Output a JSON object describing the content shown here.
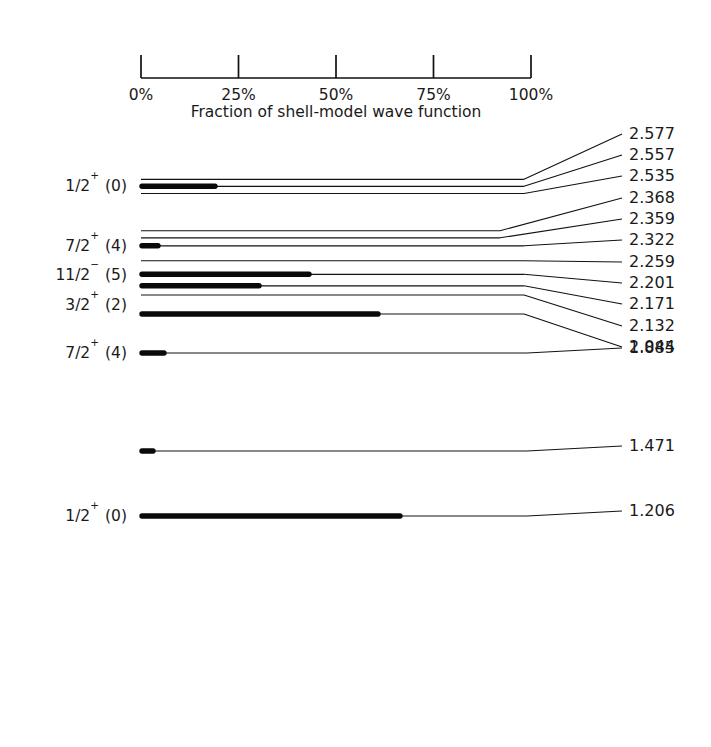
{
  "figure": {
    "kind": "nuclear-energy-level-diagram",
    "background_color": "#ffffff",
    "line_color": "#121212"
  },
  "scale_axis": {
    "caption": "Fraction of shell-model wave function",
    "tick_labels": [
      "0%",
      "25%",
      "50%",
      "75%",
      "100%"
    ],
    "tick_values": [
      0,
      25,
      50,
      75,
      100
    ],
    "x_start_px": 141,
    "x_end_px": 531,
    "baseline_y_px": 78,
    "tick_top_y_px": 55
  },
  "chart_data": {
    "type": "bar",
    "title": "",
    "subtitle": "",
    "xlabel": "Fraction of shell-model wave function",
    "ylabel": "Excitation energy (MeV)",
    "xlim": [
      0,
      100
    ],
    "xticks": [
      0,
      25,
      50,
      75,
      100
    ],
    "xticklabels": [
      "0%",
      "25%",
      "50%",
      "75%",
      "100%"
    ],
    "grid": false,
    "legend": "none",
    "orientation": "horizontal",
    "categories": [
      "2.577",
      "2.557",
      "2.535",
      "2.368",
      "2.359",
      "2.322",
      "2.259",
      "2.201",
      "2.171",
      "2.132",
      "2.044",
      "1.885",
      "1.471",
      "1.206"
    ],
    "values": [
      0,
      19,
      0,
      0,
      0,
      4,
      0,
      43,
      31,
      0,
      61,
      6,
      3,
      66
    ],
    "note": "Bar length = fraction of shell-model wave function contained in each level; level energies in MeV label each horizontal line."
  },
  "levels": [
    {
      "energy": "2.577",
      "spin_parity": "",
      "spin_sup": "",
      "l_value": "",
      "spin_display": "",
      "fraction_percent": 0,
      "line_y": 179.3,
      "thick_end_x": 141,
      "label_y": 139,
      "bend_x": 524
    },
    {
      "energy": "2.557",
      "spin_parity": "1/2",
      "spin_sup": "+",
      "l_value": "(0)",
      "spin_display": "1/2+ (0)",
      "fraction_percent": 19,
      "line_y": 186.3,
      "thick_end_x": 215,
      "label_y": 160,
      "bend_x": 524
    },
    {
      "energy": "2.535",
      "spin_parity": "",
      "spin_sup": "",
      "l_value": "",
      "spin_display": "",
      "fraction_percent": 0,
      "line_y": 193.5,
      "thick_end_x": 141,
      "label_y": 181,
      "bend_x": 524
    },
    {
      "energy": "2.368",
      "spin_parity": "",
      "spin_sup": "",
      "l_value": "",
      "spin_display": "",
      "fraction_percent": 0,
      "line_y": 230.7,
      "thick_end_x": 141,
      "label_y": 203,
      "bend_x": 500
    },
    {
      "energy": "2.359",
      "spin_parity": "",
      "spin_sup": "",
      "l_value": "",
      "spin_display": "",
      "fraction_percent": 0,
      "line_y": 237.8,
      "thick_end_x": 141,
      "label_y": 224,
      "bend_x": 500
    },
    {
      "energy": "2.322",
      "spin_parity": "7/2",
      "spin_sup": "+",
      "l_value": "(4)",
      "spin_display": "7/2+ (4)",
      "fraction_percent": 4,
      "line_y": 245.8,
      "thick_end_x": 158,
      "label_y": 245,
      "bend_x": 524
    },
    {
      "energy": "2.259",
      "spin_parity": "",
      "spin_sup": "",
      "l_value": "",
      "spin_display": "",
      "fraction_percent": 0,
      "line_y": 260.7,
      "thick_end_x": 141,
      "label_y": 267,
      "bend_x": 524
    },
    {
      "energy": "2.201",
      "spin_parity": "11/2",
      "spin_sup": "−",
      "l_value": "(5)",
      "spin_display": "11/2- (5)",
      "fraction_percent": 43,
      "line_y": 274.3,
      "thick_end_x": 309,
      "label_y": 288,
      "bend_x": 524
    },
    {
      "energy": "2.171",
      "spin_parity": "",
      "spin_sup": "",
      "l_value": "",
      "spin_display": "",
      "fraction_percent": 31,
      "line_y": 285.8,
      "thick_end_x": 259,
      "label_y": 309,
      "bend_x": 524
    },
    {
      "energy": "2.132",
      "spin_parity": "3/2",
      "spin_sup": "+",
      "l_value": "(2)",
      "spin_display": "3/2+ (2)",
      "fraction_percent": 0,
      "line_y": 295.0,
      "thick_end_x": 141,
      "label_y": 331,
      "bend_x": 524
    },
    {
      "energy": "2.044",
      "spin_parity": "",
      "spin_sup": "",
      "l_value": "",
      "spin_display": "",
      "fraction_percent": 61,
      "line_y": 314.0,
      "thick_end_x": 378,
      "label_y": 352,
      "bend_x": 524
    },
    {
      "energy": "1.885",
      "spin_parity": "7/2",
      "spin_sup": "+",
      "l_value": "(4)",
      "spin_display": "7/2+ (4)",
      "fraction_percent": 6,
      "line_y": 353.0,
      "thick_end_x": 164,
      "label_y": 353,
      "bend_x": 527
    },
    {
      "energy": "1.471",
      "spin_parity": "",
      "spin_sup": "",
      "l_value": "",
      "spin_display": "",
      "fraction_percent": 3,
      "line_y": 451.0,
      "thick_end_x": 153,
      "label_y": 451,
      "bend_x": 527
    },
    {
      "energy": "1.206",
      "spin_parity": "1/2",
      "spin_sup": "+",
      "l_value": "(0)",
      "spin_display": "1/2+ (0)",
      "fraction_percent": 66,
      "line_y": 516.0,
      "thick_end_x": 400,
      "label_y": 516,
      "bend_x": 527
    }
  ],
  "spin_labels": [
    {
      "mantissa": "1/2",
      "sup": "+",
      "l": "(0)",
      "y": 186
    },
    {
      "mantissa": "7/2",
      "sup": "+",
      "l": "(4)",
      "y": 246
    },
    {
      "mantissa": "11/2",
      "sup": "−",
      "l": "(5)",
      "y": 275
    },
    {
      "mantissa": "3/2",
      "sup": "+",
      "l": "(2)",
      "y": 305
    },
    {
      "mantissa": "7/2",
      "sup": "+",
      "l": "(4)",
      "y": 353
    },
    {
      "mantissa": "1/2",
      "sup": "+",
      "l": "(0)",
      "y": 516
    }
  ],
  "energy_label_x": 629,
  "level_start_x": 141,
  "level_end_x": 527
}
